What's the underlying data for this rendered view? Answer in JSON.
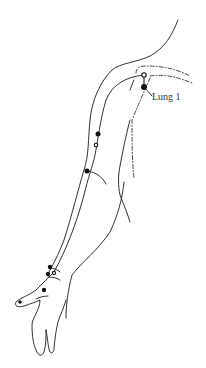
{
  "diagram": {
    "labels": [
      {
        "id": "lung-1",
        "text": "Lung 1",
        "x": 152,
        "y": 91
      }
    ],
    "points": [
      {
        "type": "open",
        "x": 144,
        "y": 75
      },
      {
        "type": "solid",
        "x": 144,
        "y": 87,
        "label": "Lung 1"
      },
      {
        "type": "solid",
        "x": 98,
        "y": 134
      },
      {
        "type": "open",
        "x": 96,
        "y": 145
      },
      {
        "type": "solid",
        "x": 87,
        "y": 171
      },
      {
        "type": "solid",
        "x": 50,
        "y": 267
      },
      {
        "type": "solid",
        "x": 48,
        "y": 274
      },
      {
        "type": "open",
        "x": 54,
        "y": 273
      },
      {
        "type": "solid",
        "x": 44,
        "y": 290
      },
      {
        "type": "solid",
        "x": 20,
        "y": 302
      }
    ],
    "colors": {
      "line": "#1a1a1a",
      "background": "#ffffff",
      "label": "#333333"
    }
  }
}
